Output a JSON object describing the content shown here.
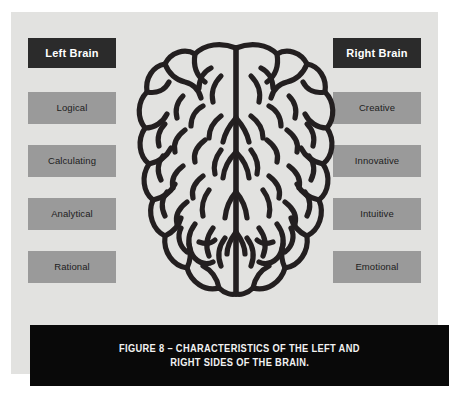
{
  "figure": {
    "panel_background": "#e2e2e0",
    "header_box_color": "#2b2b2b",
    "trait_box_color": "#9a9a9a",
    "caption_bar_color": "#090909",
    "brain_stroke_color": "#231f20"
  },
  "left_column": {
    "header": "Left Brain",
    "traits": [
      {
        "label": "Logical"
      },
      {
        "label": "Calculating"
      },
      {
        "label": "Analytical"
      },
      {
        "label": "Rational"
      }
    ]
  },
  "right_column": {
    "header": "Right Brain",
    "traits": [
      {
        "label": "Creative"
      },
      {
        "label": "Innovative"
      },
      {
        "label": "Intuitive"
      },
      {
        "label": "Emotional"
      }
    ]
  },
  "illustration": {
    "name": "human-brain-top-view",
    "hemispheres": [
      "left hemisphere",
      "right hemisphere"
    ]
  },
  "caption": {
    "line1": "FIGURE 8 – CHARACTERISTICS OF THE LEFT AND",
    "line2": "RIGHT SIDES OF THE BRAIN."
  }
}
